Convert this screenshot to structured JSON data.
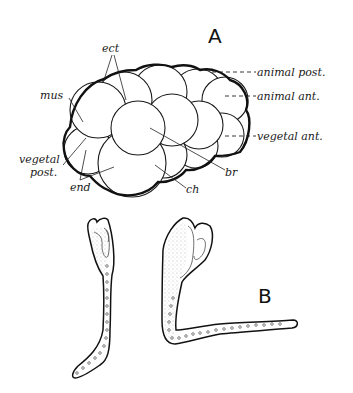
{
  "figure": {
    "panel_a": {
      "label": "A",
      "labels": {
        "ect": "ect",
        "mus": "mus",
        "vegetal_post_line1": "vegetal",
        "vegetal_post_line2": "post.",
        "end": "end",
        "ch": "ch",
        "br": "br",
        "animal_post": "animal post.",
        "animal_ant": "animal ant.",
        "vegetal_ant": "vegetal ant."
      }
    },
    "panel_b": {
      "label": "B"
    },
    "colors": {
      "ink": "#111111",
      "background": "#ffffff"
    }
  }
}
